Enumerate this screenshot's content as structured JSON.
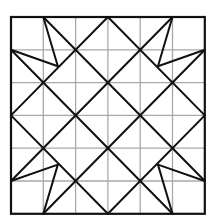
{
  "diagram": {
    "type": "quilt-block-pattern",
    "grid_size": 6,
    "colors": {
      "background": "#ffffff",
      "grid": "#a8a8a8",
      "lines": "#111111"
    },
    "placement": {
      "x0": 11,
      "y0": 17,
      "cell_w": 32.3,
      "cell_h": 32.8
    },
    "diamond": [
      [
        3,
        0
      ],
      [
        6,
        3
      ],
      [
        3,
        6
      ],
      [
        0,
        3
      ]
    ],
    "long_diagonals": [
      [
        [
          5,
          0
        ],
        [
          0,
          5
        ]
      ],
      [
        [
          1,
          0
        ],
        [
          6,
          5
        ]
      ],
      [
        [
          0,
          1
        ],
        [
          5,
          6
        ]
      ],
      [
        [
          6,
          1
        ],
        [
          1,
          6
        ]
      ]
    ],
    "star_points": [
      {
        "tip_a": [
          1,
          0
        ],
        "tip_b": [
          0,
          1
        ],
        "inner": [
          1.45,
          1.5
        ]
      },
      {
        "tip_a": [
          5,
          0
        ],
        "tip_b": [
          6,
          1
        ],
        "inner": [
          4.55,
          1.5
        ]
      },
      {
        "tip_a": [
          0,
          5
        ],
        "tip_b": [
          1,
          6
        ],
        "inner": [
          1.45,
          4.5
        ]
      },
      {
        "tip_a": [
          6,
          5
        ],
        "tip_b": [
          5,
          6
        ],
        "inner": [
          4.55,
          4.5
        ]
      }
    ]
  }
}
